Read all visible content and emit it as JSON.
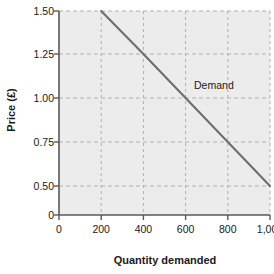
{
  "chart_data": {
    "type": "line",
    "title": "",
    "xlabel": "Quantity demanded",
    "ylabel": "Price (£)",
    "x_ticks": [
      "0",
      "200",
      "400",
      "600",
      "800",
      "1,000"
    ],
    "x_tick_values": [
      0,
      200,
      400,
      600,
      800,
      1000
    ],
    "y_ticks": [
      "0",
      "0.50",
      "0.75",
      "1.00",
      "1.25",
      "1.50"
    ],
    "y_tick_values": [
      0,
      0.5,
      0.75,
      1.0,
      1.25,
      1.5
    ],
    "xlim": [
      0,
      1000
    ],
    "ylim": [
      0,
      1.5
    ],
    "grid": true,
    "legend_position": "inline-annotation",
    "series": [
      {
        "name": "Demand",
        "color": "#6e6e6e",
        "points": [
          {
            "x": 200,
            "y": 1.5
          },
          {
            "x": 400,
            "y": 1.25
          },
          {
            "x": 600,
            "y": 1.0
          },
          {
            "x": 800,
            "y": 0.75
          },
          {
            "x": 1000,
            "y": 0.5
          }
        ]
      }
    ],
    "annotations": [
      {
        "text": "Demand",
        "x": 640,
        "y": 1.05
      }
    ],
    "colors": {
      "plot_background": "#ececec",
      "grid": "#b0b0b0",
      "axis": "#595959",
      "text": "#1a1a1a",
      "line": "#6e6e6e"
    }
  }
}
